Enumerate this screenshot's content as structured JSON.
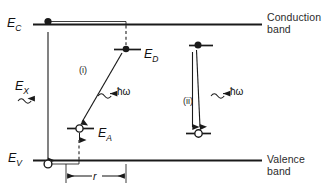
{
  "figure": {
    "kind": "semiconductor-band-diagram",
    "background_color": "#ffffff",
    "line_color": "#1a1a1a",
    "width": 325,
    "height": 192
  },
  "bands": {
    "conduction": {
      "edge_label": "E",
      "edge_sub": "C",
      "caption_line1": "Conduction",
      "caption_line2": "band"
    },
    "valence": {
      "edge_label": "E",
      "edge_sub": "V",
      "caption_line1": "Valence",
      "caption_line2": "band"
    }
  },
  "levels": {
    "donor": {
      "label": "E",
      "sub": "D"
    },
    "acceptor": {
      "label": "E",
      "sub": "A"
    }
  },
  "transitions": [
    {
      "id": "band-to-band",
      "label": "E",
      "sub": "X",
      "photon_glyph": "⇝",
      "photon_label": ""
    },
    {
      "id": "distant-pair",
      "marker": "(i)",
      "photon_glyph": "⇝→",
      "photon_label": "ħω"
    },
    {
      "id": "close-pair",
      "marker": "(ii)",
      "photon_glyph": "⇝→",
      "photon_label": "ħω"
    }
  ],
  "dimension": {
    "name": "pair-separation",
    "label": "r"
  },
  "carriers": {
    "electron_symbol": "filled-circle",
    "hole_symbol": "open-circle"
  }
}
